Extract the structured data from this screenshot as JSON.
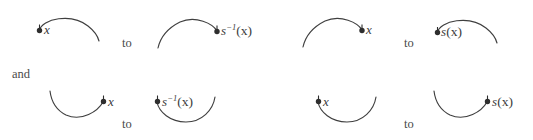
{
  "figure": {
    "background_color": "#ffffff",
    "stroke_color": "#3f3f3f",
    "dot_color": "#2e2e2e",
    "text_color": "#3b3b3b"
  },
  "connectors": {
    "and_label": "and",
    "to_label_1": "to",
    "to_label_2": "to",
    "to_label_3": "to",
    "to_label_4": "to"
  },
  "rows": [
    {
      "name": "top-row",
      "arc_orientation": "cap",
      "arcs": [
        {
          "id": "top-arc-1",
          "shape": "cap",
          "dot_side": "left",
          "label_parts": {
            "base": "x",
            "exponent": "",
            "argument": ""
          },
          "label_text": "x"
        },
        {
          "id": "top-arc-2",
          "shape": "cap",
          "dot_side": "right",
          "label_parts": {
            "base": "s",
            "exponent": "−1",
            "argument": "(x)"
          },
          "label_text": "s⁻¹(x)"
        },
        {
          "id": "top-arc-3",
          "shape": "cap",
          "dot_side": "right",
          "label_parts": {
            "base": "x",
            "exponent": "",
            "argument": ""
          },
          "label_text": "x"
        },
        {
          "id": "top-arc-4",
          "shape": "cap",
          "dot_side": "left",
          "label_parts": {
            "base": "s",
            "exponent": "",
            "argument": "(x)"
          },
          "label_text": "s(x)"
        }
      ]
    },
    {
      "name": "bottom-row",
      "arc_orientation": "cup",
      "arcs": [
        {
          "id": "bottom-arc-1",
          "shape": "cup",
          "dot_side": "right",
          "label_parts": {
            "base": "x",
            "exponent": "",
            "argument": ""
          },
          "label_text": "x"
        },
        {
          "id": "bottom-arc-2",
          "shape": "cup",
          "dot_side": "left",
          "label_parts": {
            "base": "s",
            "exponent": "−1",
            "argument": "(x)"
          },
          "label_text": "s⁻¹(x)"
        },
        {
          "id": "bottom-arc-3",
          "shape": "cup",
          "dot_side": "left",
          "label_parts": {
            "base": "x",
            "exponent": "",
            "argument": ""
          },
          "label_text": "x"
        },
        {
          "id": "bottom-arc-4",
          "shape": "cup",
          "dot_side": "right",
          "label_parts": {
            "base": "s",
            "exponent": "",
            "argument": "(x)"
          },
          "label_text": "s(x)"
        }
      ]
    }
  ]
}
